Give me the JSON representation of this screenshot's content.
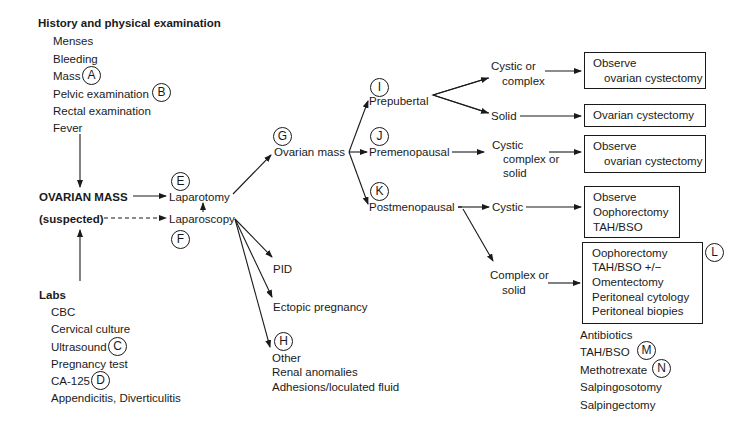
{
  "history": {
    "title": "History and physical examination",
    "items": [
      "Menses",
      "Bleeding",
      "Mass",
      "Pelvic examination",
      "Rectal examination",
      "Fever"
    ],
    "markers": {
      "mass": "A",
      "pelvic": "B"
    }
  },
  "center": {
    "title_line1": "OVARIAN MASS",
    "title_line2": "(suspected)"
  },
  "labs": {
    "title": "Labs",
    "items": [
      "CBC",
      "Cervical culture",
      "Ultrasound",
      "Pregnancy test",
      "CA-125",
      "Appendicitis, Diverticulitis"
    ],
    "markers": {
      "ultrasound": "C",
      "ca125": "D"
    }
  },
  "procedures": {
    "laparotomy": "Laparotomy",
    "laparoscopy": "Laparoscopy",
    "marker_laparotomy": "E",
    "marker_laparoscopy": "F"
  },
  "ovarian_mass": {
    "label": "Ovarian mass",
    "marker": "G"
  },
  "laparoscopy_findings": {
    "pid": "PID",
    "ectopic": "Ectopic pregnancy",
    "other_marker": "H",
    "other": [
      "Other",
      "Renal anomalies",
      "Adhesions/loculated fluid"
    ]
  },
  "age_groups": {
    "prepubertal": {
      "label": "Prepubertal",
      "marker": "I"
    },
    "premenopausal": {
      "label": "Premenopausal",
      "marker": "J"
    },
    "postmenopausal": {
      "label": "Postmenopausal",
      "marker": "K"
    }
  },
  "findings": {
    "pre_cystic": [
      "Cystic or",
      "complex"
    ],
    "pre_solid": "Solid",
    "premeno": [
      "Cystic",
      "complex or",
      "solid"
    ],
    "post_cystic": "Cystic",
    "post_complex": [
      "Complex or",
      "solid"
    ]
  },
  "outcomes": {
    "box1": [
      "Observe",
      "ovarian cystectomy"
    ],
    "box2": [
      "Ovarian cystectomy"
    ],
    "box3": [
      "Observe",
      "ovarian cystectomy"
    ],
    "box4": [
      "Observe",
      "Oophorectomy",
      "TAH/BSO"
    ],
    "box5": [
      "Oophorectomy",
      "TAH/BSO +/−",
      "Omentectomy",
      "Peritoneal cytology",
      "Peritoneal biopies"
    ],
    "box5_marker": "L"
  },
  "treatments": {
    "items": [
      "Antibiotics",
      "TAH/BSO",
      "Methotrexate",
      "Salpingosotomy",
      "Salpingectomy"
    ],
    "markers": {
      "tahbso": "M",
      "methotrexate": "N"
    }
  }
}
